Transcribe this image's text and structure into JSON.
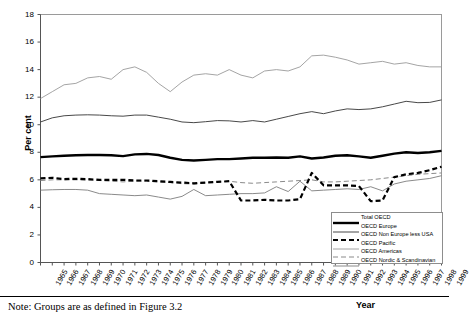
{
  "axes": {
    "ylabel": "Per cent",
    "xlabel": "Year",
    "yticks": [
      "0",
      "2",
      "4",
      "6",
      "8",
      "10",
      "12",
      "14",
      "16",
      "18"
    ],
    "ylim": [
      0,
      18
    ],
    "xlim": [
      1965,
      1999
    ]
  },
  "note": "Note: Groups are as defined in Figure 3.2",
  "legend": {
    "items": [
      {
        "label": "Total OECD",
        "style": "solid-thick",
        "color": "#000000"
      },
      {
        "label": "OECD Europe",
        "style": "solid-thin",
        "color": "#333333"
      },
      {
        "label": "OECD Non Europe less USA",
        "style": "dashed-thick",
        "color": "#000000"
      },
      {
        "label": "OECD Pacific",
        "style": "solid-thin",
        "color": "#9a9a9a"
      },
      {
        "label": "OECD Americas",
        "style": "dashed-thin",
        "color": "#8a8a8a"
      },
      {
        "label": "OECD Nordic & Scandinavian",
        "style": "solid-thin",
        "color": "#7d7d7d"
      }
    ]
  },
  "chart_data": {
    "type": "line",
    "title": "",
    "xlabel": "Year",
    "ylabel": "Per cent",
    "ylim": [
      0,
      18
    ],
    "grid": false,
    "legend_position": "bottom-right",
    "x": [
      1965,
      1966,
      1967,
      1968,
      1969,
      1970,
      1971,
      1972,
      1973,
      1974,
      1975,
      1976,
      1977,
      1978,
      1979,
      1980,
      1981,
      1982,
      1983,
      1984,
      1985,
      1986,
      1987,
      1988,
      1989,
      1990,
      1991,
      1992,
      1993,
      1994,
      1995,
      1996,
      1997,
      1998,
      1999
    ],
    "categories": [
      "1965",
      "1966",
      "1967",
      "1968",
      "1969",
      "1970",
      "1971",
      "1972",
      "1973",
      "1974",
      "1975",
      "1976",
      "1977",
      "1978",
      "1979",
      "1980",
      "1981",
      "1982",
      "1983",
      "1984",
      "1985",
      "1986",
      "1987",
      "1988",
      "1989",
      "1990",
      "1991",
      "1992",
      "1993",
      "1994",
      "1995",
      "1996",
      "1997",
      "1998",
      "1999"
    ],
    "series": [
      {
        "name": "Total OECD",
        "style": "solid-thick",
        "color": "#000000",
        "values": [
          7.65,
          7.7,
          7.75,
          7.78,
          7.8,
          7.8,
          7.78,
          7.72,
          7.85,
          7.88,
          7.8,
          7.6,
          7.45,
          7.4,
          7.45,
          7.5,
          7.5,
          7.55,
          7.6,
          7.6,
          7.62,
          7.6,
          7.7,
          7.55,
          7.62,
          7.75,
          7.78,
          7.7,
          7.6,
          7.75,
          7.9,
          8.0,
          7.95,
          8.0,
          8.1
        ]
      },
      {
        "name": "OECD Europe",
        "style": "solid-thin",
        "color": "#333333",
        "values": [
          10.2,
          10.5,
          10.65,
          10.7,
          10.72,
          10.7,
          10.65,
          10.62,
          10.7,
          10.7,
          10.55,
          10.4,
          10.2,
          10.15,
          10.22,
          10.3,
          10.28,
          10.2,
          10.3,
          10.2,
          10.4,
          10.6,
          10.8,
          10.95,
          10.8,
          11.0,
          11.15,
          11.1,
          11.15,
          11.3,
          11.5,
          11.7,
          11.6,
          11.62,
          11.8
        ]
      },
      {
        "name": "OECD Non Europe less USA",
        "style": "dashed-thick",
        "color": "#000000",
        "values": [
          6.1,
          6.15,
          6.05,
          6.08,
          6.05,
          6.0,
          6.0,
          6.0,
          5.95,
          5.95,
          5.9,
          5.85,
          5.8,
          5.75,
          5.8,
          5.85,
          5.9,
          4.5,
          4.5,
          4.55,
          4.5,
          4.5,
          4.6,
          6.5,
          5.6,
          5.6,
          5.6,
          5.55,
          4.45,
          4.5,
          6.2,
          6.4,
          6.5,
          6.7,
          6.95
        ]
      },
      {
        "name": "OECD Pacific",
        "style": "solid-thin",
        "color": "#9a9a9a",
        "values": [
          11.9,
          12.4,
          12.9,
          13.0,
          13.4,
          13.5,
          13.3,
          14.0,
          14.2,
          13.8,
          13.0,
          12.4,
          13.1,
          13.6,
          13.7,
          13.6,
          14.0,
          13.6,
          13.4,
          13.9,
          14.0,
          13.9,
          14.2,
          15.0,
          15.05,
          14.9,
          14.7,
          14.4,
          14.5,
          14.6,
          14.4,
          14.5,
          14.3,
          14.2,
          14.2
        ]
      },
      {
        "name": "OECD Americas",
        "style": "dashed-thin",
        "color": "#8a8a8a",
        "values": [
          5.95,
          6.0,
          6.0,
          6.0,
          5.98,
          5.95,
          5.9,
          5.85,
          5.9,
          5.9,
          5.85,
          5.8,
          5.72,
          5.7,
          5.78,
          5.85,
          5.9,
          5.8,
          5.75,
          5.8,
          5.85,
          5.9,
          5.95,
          6.0,
          5.85,
          5.85,
          5.9,
          5.95,
          6.0,
          6.1,
          6.2,
          6.3,
          6.4,
          6.45,
          6.5
        ]
      },
      {
        "name": "OECD Nordic & Scandinavian",
        "style": "solid-thin",
        "color": "#7d7d7d",
        "values": [
          5.25,
          5.28,
          5.3,
          5.3,
          5.25,
          5.0,
          4.95,
          4.9,
          4.85,
          4.9,
          4.75,
          4.6,
          4.8,
          5.3,
          4.85,
          4.9,
          4.95,
          5.0,
          5.0,
          5.05,
          5.5,
          5.15,
          5.9,
          5.2,
          5.25,
          5.3,
          5.35,
          5.3,
          5.5,
          5.2,
          5.7,
          5.9,
          6.0,
          6.1,
          6.3
        ]
      }
    ]
  }
}
